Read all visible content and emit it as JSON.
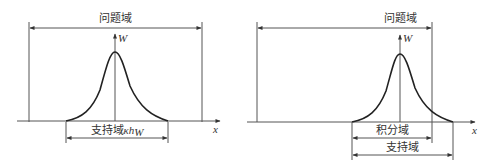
{
  "left_panel": {
    "problem_domain_label": "问题域",
    "axis_y_label": "W",
    "axis_x_label": "x",
    "support_domain_label": "支持域",
    "support_domain_size_label": "κh",
    "support_domain_size_subscript": "W"
  },
  "right_panel": {
    "problem_domain_label": "问题域",
    "axis_y_label": "W",
    "axis_x_label": "x",
    "integration_domain_label": "积分域",
    "support_domain_label": "支持域"
  },
  "colors": {
    "line": "#555555",
    "curve": "#222222",
    "text": "#333333"
  }
}
